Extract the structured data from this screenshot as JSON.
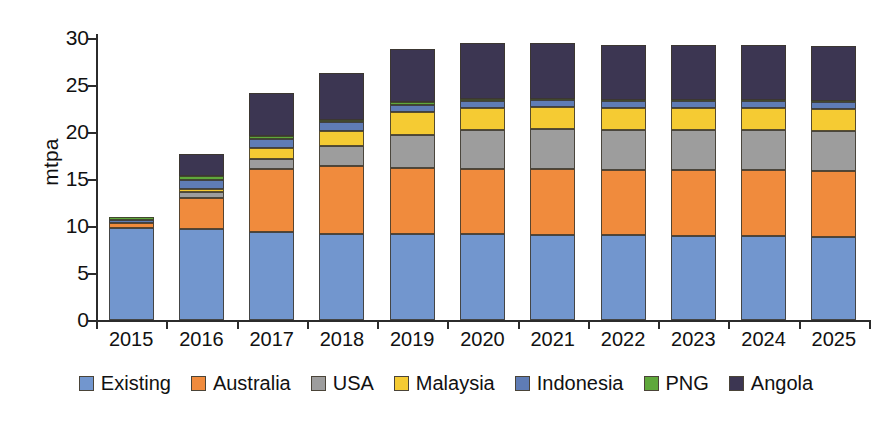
{
  "chart_data": {
    "type": "bar",
    "stacked": true,
    "title": "",
    "xlabel": "",
    "ylabel": "mtpa",
    "ylim": [
      0,
      30
    ],
    "yticks": [
      0,
      5,
      10,
      15,
      20,
      25,
      30
    ],
    "ytick_labels": [
      "0",
      "5",
      "10",
      "15",
      "20",
      "25",
      "30"
    ],
    "grid": false,
    "legend_position": "bottom",
    "categories": [
      "2015",
      "2016",
      "2017",
      "2018",
      "2019",
      "2020",
      "2021",
      "2022",
      "2023",
      "2024",
      "2025"
    ],
    "series": [
      {
        "name": "Existing",
        "color": "#7296ce",
        "values": [
          9.8,
          9.7,
          9.4,
          9.2,
          9.2,
          9.1,
          9.0,
          9.0,
          8.9,
          8.9,
          8.8
        ]
      },
      {
        "name": "Australia",
        "color": "#f08b3d",
        "values": [
          0.5,
          3.3,
          6.7,
          7.2,
          7.0,
          7.0,
          7.1,
          7.0,
          7.1,
          7.1,
          7.1
        ]
      },
      {
        "name": "USA",
        "color": "#9d9d9d",
        "values": [
          0.0,
          0.6,
          1.0,
          2.1,
          3.5,
          4.1,
          4.2,
          4.2,
          4.2,
          4.2,
          4.2
        ]
      },
      {
        "name": "Malaysia",
        "color": "#f5cb33",
        "values": [
          0.0,
          0.3,
          1.2,
          1.6,
          2.4,
          2.4,
          2.4,
          2.4,
          2.4,
          2.4,
          2.4
        ]
      },
      {
        "name": "Indonesia",
        "color": "#5f7cb5",
        "values": [
          0.3,
          1.0,
          1.0,
          1.0,
          0.8,
          0.7,
          0.7,
          0.7,
          0.7,
          0.7,
          0.7
        ]
      },
      {
        "name": "PNG",
        "color": "#5fa83b",
        "values": [
          0.4,
          0.4,
          0.3,
          0.2,
          0.3,
          0.2,
          0.1,
          0.1,
          0.1,
          0.1,
          0.1
        ]
      },
      {
        "name": "Angola",
        "color": "#3c3652",
        "values": [
          0.0,
          2.4,
          4.6,
          5.0,
          5.6,
          6.0,
          6.0,
          5.9,
          5.9,
          5.9,
          5.9
        ]
      }
    ],
    "totals": [
      11.0,
      17.7,
      24.2,
      26.3,
      28.8,
      29.5,
      29.5,
      29.3,
      29.3,
      29.3,
      29.2
    ]
  },
  "legend": {
    "items": [
      {
        "label": "Existing",
        "color": "#7296ce"
      },
      {
        "label": "Australia",
        "color": "#f08b3d"
      },
      {
        "label": "USA",
        "color": "#9d9d9d"
      },
      {
        "label": "Malaysia",
        "color": "#f5cb33"
      },
      {
        "label": "Indonesia",
        "color": "#5f7cb5"
      },
      {
        "label": "PNG",
        "color": "#5fa83b"
      },
      {
        "label": "Angola",
        "color": "#3c3652"
      }
    ]
  }
}
